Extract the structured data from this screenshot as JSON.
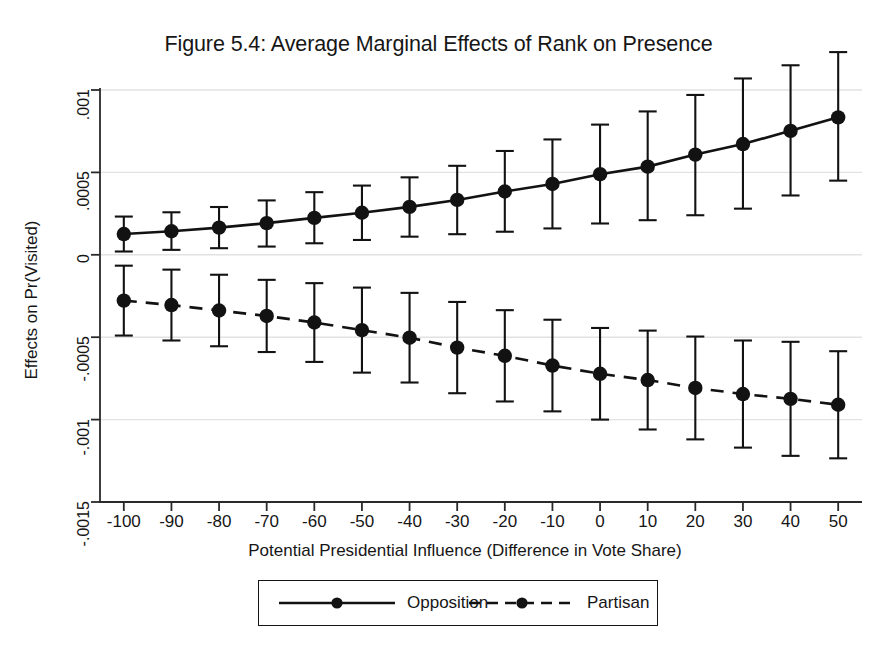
{
  "figure": {
    "title": "Figure 5.4: Average Marginal Effects of Rank on Presence"
  },
  "legend": {
    "opposition_label": "Opposition",
    "partisan_label": "Partisan"
  },
  "axes": {
    "xlabel": "Potential Presidential Influence (Difference in Vote Share)",
    "ylabel": "Effects on Pr(Visited)",
    "ytick_labels": [
      ".001",
      ".0005",
      "0",
      "-.0005",
      "-.001",
      "-.0015"
    ],
    "xtick_labels": [
      "-100",
      "-90",
      "-80",
      "-70",
      "-60",
      "-50",
      "-40",
      "-30",
      "-20",
      "-10",
      "0",
      "10",
      "20",
      "30",
      "40",
      "50"
    ]
  },
  "chart_data": {
    "type": "line",
    "title": "Figure 5.4: Average Marginal Effects of Rank on Presence",
    "xlabel": "Potential Presidential Influence (Difference in Vote Share)",
    "ylabel": "Effects on Pr(Visited)",
    "x": [
      -100,
      -90,
      -80,
      -70,
      -60,
      -50,
      -40,
      -30,
      -20,
      -10,
      0,
      10,
      20,
      30,
      40,
      50
    ],
    "xlim": [
      -105,
      55
    ],
    "ylim": [
      -0.0015,
      0.001
    ],
    "yticks": [
      0.001,
      0.0005,
      0,
      -0.0005,
      -0.001,
      -0.0015
    ],
    "ytick_labels": [
      ".001",
      ".0005",
      "0",
      "-.0005",
      "-.001",
      "-.0015"
    ],
    "xticks": [
      -100,
      -90,
      -80,
      -70,
      -60,
      -50,
      -40,
      -30,
      -20,
      -10,
      0,
      10,
      20,
      30,
      40,
      50
    ],
    "grid": true,
    "grid_axis": "y",
    "legend_position": "below-center",
    "error_bars": "95% confidence interval",
    "series": [
      {
        "name": "Opposition",
        "style": "solid",
        "marker": "filled-circle",
        "values": [
          0.000126,
          0.000143,
          0.000165,
          0.000192,
          0.000224,
          0.000255,
          0.000291,
          0.000333,
          0.000384,
          0.00043,
          0.000489,
          0.000535,
          0.000608,
          0.000672,
          0.000752,
          0.000834
        ],
        "ci_lower": [
          2e-05,
          3e-05,
          4e-05,
          5e-05,
          7e-05,
          9e-05,
          0.00011,
          0.000125,
          0.00014,
          0.00016,
          0.00019,
          0.00021,
          0.00024,
          0.00028,
          0.00036,
          0.00045
        ],
        "ci_upper": [
          0.000232,
          0.000258,
          0.00029,
          0.00033,
          0.00038,
          0.00042,
          0.00047,
          0.00054,
          0.00063,
          0.0007,
          0.00079,
          0.00087,
          0.00097,
          0.00107,
          0.00115,
          0.00123
        ]
      },
      {
        "name": "Partisan",
        "style": "dashed",
        "marker": "filled-circle",
        "values": [
          -0.000278,
          -0.000305,
          -0.000338,
          -0.000371,
          -0.000411,
          -0.000457,
          -0.000503,
          -0.000563,
          -0.000613,
          -0.000672,
          -0.000722,
          -0.00076,
          -0.000808,
          -0.000845,
          -0.000874,
          -0.00091
        ],
        "ci_lower": [
          -0.00049,
          -0.00052,
          -0.000555,
          -0.00059,
          -0.00065,
          -0.000715,
          -0.000775,
          -0.00084,
          -0.00089,
          -0.00095,
          -0.001,
          -0.00106,
          -0.00112,
          -0.00117,
          -0.00122,
          -0.001235
        ],
        "ci_upper": [
          -6.6e-05,
          -9e-05,
          -0.000121,
          -0.000152,
          -0.000172,
          -0.000199,
          -0.000231,
          -0.000286,
          -0.000336,
          -0.000394,
          -0.000444,
          -0.00046,
          -0.000496,
          -0.00052,
          -0.000528,
          -0.000585
        ]
      }
    ]
  }
}
